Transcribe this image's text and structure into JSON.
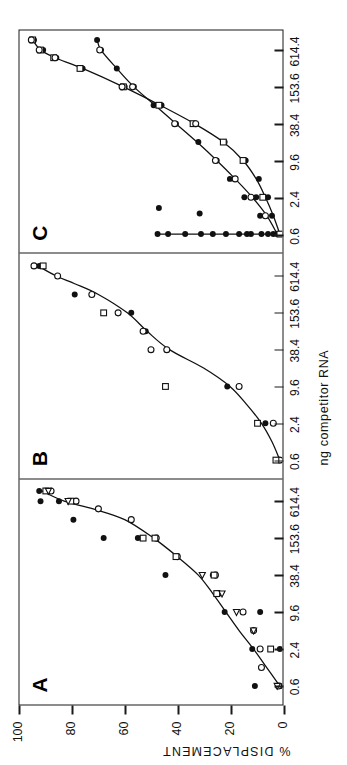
{
  "figure": {
    "caption_axis_x": "ng competitor RNA",
    "caption_axis_y": "% DISPLACEMENT",
    "panel_labels": [
      "A",
      "B",
      "C"
    ]
  },
  "chart_data": [
    {
      "type": "scatter",
      "panel": "A",
      "title": "A",
      "xlabel": "ng competitor RNA",
      "ylabel": "% DISPLACEMENT",
      "xlim": [
        0.3,
        1400
      ],
      "ylim": [
        0,
        100
      ],
      "xscale": "log",
      "xticks": [
        0.6,
        2.4,
        9.6,
        38.4,
        153.6,
        614.4
      ],
      "xticklabels": [
        "0.6",
        "2.4",
        "9.6",
        "38.4",
        "153.6",
        "614.4"
      ],
      "yticks": [
        0,
        20,
        40,
        60,
        80,
        100
      ],
      "yticklabels": [
        "0",
        "20",
        "40",
        "60",
        "80",
        "100"
      ],
      "grid": false,
      "legend": "none",
      "series": [
        {
          "name": "filled-circle",
          "marker": "filled-circle",
          "points": [
            [
              0.6,
              10.5
            ],
            [
              2.4,
              11.5
            ],
            [
              2.4,
              1.0
            ],
            [
              9.6,
              22.0
            ],
            [
              9.6,
              8.5
            ],
            [
              38.4,
              26.5
            ],
            [
              38.4,
              44.5
            ],
            [
              153.6,
              53.5
            ],
            [
              153.6,
              55.0
            ],
            [
              153.6,
              68.0
            ],
            [
              307.2,
              79.5
            ],
            [
              614.4,
              85.0
            ],
            [
              614.4,
              92.0
            ],
            [
              900.0,
              92.5
            ],
            [
              0.6,
              0.8
            ]
          ]
        },
        {
          "name": "open-circle",
          "marker": "open-circle",
          "points": [
            [
              0.6,
              1.5
            ],
            [
              1.2,
              8.0
            ],
            [
              2.4,
              8.5
            ],
            [
              4.8,
              11.0
            ],
            [
              9.6,
              15.0
            ],
            [
              19.2,
              24.5
            ],
            [
              38.4,
              25.5
            ],
            [
              76.8,
              40.0
            ],
            [
              153.6,
              48.0
            ],
            [
              307.2,
              57.5
            ],
            [
              460.0,
              70.0
            ],
            [
              614.4,
              78.5
            ],
            [
              900.0,
              88.0
            ]
          ]
        },
        {
          "name": "open-square",
          "marker": "open-square",
          "points": [
            [
              2.4,
              4.5
            ],
            [
              19.2,
              25.0
            ],
            [
              38.4,
              26.0
            ],
            [
              76.8,
              40.5
            ],
            [
              153.6,
              48.5
            ],
            [
              153.6,
              53.0
            ],
            [
              614.4,
              80.5
            ],
            [
              900.0,
              90.0
            ]
          ]
        },
        {
          "name": "open-triangle",
          "marker": "open-triangle",
          "points": [
            [
              0.6,
              2.0
            ],
            [
              4.8,
              11.0
            ],
            [
              9.6,
              17.5
            ],
            [
              19.2,
              23.0
            ],
            [
              38.4,
              30.5
            ],
            [
              614.4,
              81.5
            ],
            [
              900.0,
              89.0
            ]
          ]
        }
      ],
      "fitted_curve": [
        [
          0.6,
          1.0
        ],
        [
          1.2,
          6.0
        ],
        [
          2.4,
          11.0
        ],
        [
          4.8,
          16.5
        ],
        [
          9.6,
          21.5
        ],
        [
          19.2,
          26.5
        ],
        [
          38.4,
          32.0
        ],
        [
          76.8,
          40.0
        ],
        [
          153.6,
          49.0
        ],
        [
          307.2,
          60.0
        ],
        [
          460.0,
          72.0
        ],
        [
          614.4,
          83.0
        ],
        [
          900.0,
          91.5
        ]
      ]
    },
    {
      "type": "scatter",
      "panel": "B",
      "title": "B",
      "xlabel": "ng competitor RNA",
      "ylabel": "% DISPLACEMENT",
      "xlim": [
        0.3,
        1400
      ],
      "ylim": [
        0,
        100
      ],
      "xscale": "log",
      "xticks": [
        0.6,
        2.4,
        9.6,
        38.4,
        153.6,
        614.4
      ],
      "xticklabels": [
        "0.6",
        "2.4",
        "9.6",
        "38.4",
        "153.6",
        "614.4"
      ],
      "yticks": [
        0,
        20,
        40,
        60,
        80,
        100
      ],
      "grid": false,
      "legend": "none",
      "series": [
        {
          "name": "filled-circle",
          "marker": "filled-circle",
          "points": [
            [
              0.6,
              2.5
            ],
            [
              0.6,
              0.5
            ],
            [
              2.4,
              6.5
            ],
            [
              9.6,
              21.0
            ],
            [
              38.4,
              44.0
            ],
            [
              76.8,
              52.0
            ],
            [
              153.6,
              57.5
            ],
            [
              307.2,
              79.0
            ],
            [
              900.0,
              92.5
            ]
          ]
        },
        {
          "name": "open-circle",
          "marker": "open-circle",
          "points": [
            [
              0.6,
              1.0
            ],
            [
              2.4,
              3.5
            ],
            [
              9.6,
              16.5
            ],
            [
              38.4,
              44.0
            ],
            [
              38.4,
              50.0
            ],
            [
              76.8,
              53.0
            ],
            [
              153.6,
              62.5
            ],
            [
              307.2,
              72.5
            ],
            [
              614.4,
              85.5
            ],
            [
              900.0,
              94.5
            ]
          ]
        },
        {
          "name": "open-square",
          "marker": "open-square",
          "points": [
            [
              0.6,
              2.5
            ],
            [
              2.4,
              9.5
            ],
            [
              9.6,
              44.5
            ],
            [
              153.6,
              68.0
            ],
            [
              900.0,
              91.0
            ]
          ]
        }
      ],
      "fitted_curve": [
        [
          0.6,
          1.0
        ],
        [
          1.2,
          4.0
        ],
        [
          2.4,
          8.0
        ],
        [
          4.8,
          13.5
        ],
        [
          9.6,
          20.0
        ],
        [
          19.2,
          30.0
        ],
        [
          38.4,
          43.0
        ],
        [
          76.8,
          51.5
        ],
        [
          153.6,
          59.0
        ],
        [
          307.2,
          70.0
        ],
        [
          460.0,
          79.0
        ],
        [
          614.4,
          86.0
        ],
        [
          900.0,
          93.0
        ]
      ]
    },
    {
      "type": "scatter",
      "panel": "C",
      "title": "C",
      "xlabel": "ng competitor RNA",
      "ylabel": "% DISPLACEMENT",
      "xlim": [
        0.3,
        1400
      ],
      "ylim": [
        0,
        100
      ],
      "xscale": "log",
      "xticks": [
        0.6,
        2.4,
        9.6,
        38.4,
        153.6,
        614.4
      ],
      "xticklabels": [
        "0.6",
        "2.4",
        "9.6",
        "38.4",
        "153.6",
        "614.4"
      ],
      "yticks": [
        0,
        20,
        40,
        60,
        80,
        100
      ],
      "grid": false,
      "legend": "none",
      "comment": "three response groups: a non-competing flat baseline near 0%, an intermediate curve saturating near 70%, and a strong competitor curve saturating near 95%",
      "series": [
        {
          "name": "baseline-filled-circle",
          "marker": "filled-circle",
          "points": [
            [
              0.6,
              0.5
            ],
            [
              0.6,
              3.5
            ],
            [
              0.6,
              5.5
            ],
            [
              0.6,
              8.0
            ],
            [
              0.6,
              12.0
            ],
            [
              0.6,
              13.5
            ],
            [
              0.6,
              16.5
            ],
            [
              0.6,
              21.5
            ],
            [
              0.6,
              26.5
            ],
            [
              0.6,
              31.0
            ],
            [
              0.6,
              37.0
            ],
            [
              1.3,
              31.5
            ],
            [
              0.6,
              43.5
            ],
            [
              0.6,
              47.5
            ],
            [
              1.6,
              47.0
            ]
          ]
        },
        {
          "name": "mid-curve-filled-circle",
          "marker": "filled-circle",
          "points": [
            [
              0.6,
              2.0
            ],
            [
              1.2,
              4.0
            ],
            [
              1.2,
              8.5
            ],
            [
              2.4,
              10.0
            ],
            [
              2.4,
              14.5
            ],
            [
              4.8,
              20.0
            ],
            [
              9.6,
              25.0
            ],
            [
              19.2,
              32.0
            ],
            [
              38.4,
              40.5
            ],
            [
              76.8,
              49.0
            ],
            [
              153.6,
              56.5
            ],
            [
              307.2,
              63.0
            ],
            [
              614.4,
              69.0
            ],
            [
              900.0,
              70.5
            ]
          ]
        },
        {
          "name": "mid-curve-open-circle",
          "marker": "open-circle",
          "points": [
            [
              1.2,
              6.5
            ],
            [
              2.4,
              12.0
            ],
            [
              4.8,
              18.0
            ],
            [
              9.6,
              25.5
            ],
            [
              38.4,
              41.0
            ],
            [
              153.6,
              57.0
            ],
            [
              614.4,
              69.5
            ]
          ]
        },
        {
          "name": "strong-filled-circle",
          "marker": "filled-circle",
          "points": [
            [
              0.6,
              1.5
            ],
            [
              2.4,
              5.5
            ],
            [
              4.8,
              9.0
            ],
            [
              9.6,
              14.0
            ],
            [
              19.2,
              22.0
            ],
            [
              38.4,
              33.5
            ],
            [
              76.8,
              46.0
            ],
            [
              153.6,
              60.0
            ],
            [
              307.2,
              76.0
            ],
            [
              460.0,
              86.0
            ],
            [
              614.4,
              91.0
            ],
            [
              900.0,
              94.5
            ]
          ]
        },
        {
          "name": "strong-open-square",
          "marker": "open-square",
          "points": [
            [
              0.6,
              1.0
            ],
            [
              2.4,
              7.5
            ],
            [
              9.6,
              15.0
            ],
            [
              19.2,
              22.5
            ],
            [
              38.4,
              34.0
            ],
            [
              76.8,
              47.0
            ],
            [
              153.6,
              60.5
            ],
            [
              307.2,
              77.0
            ],
            [
              460.0,
              87.0
            ],
            [
              614.4,
              92.0
            ],
            [
              900.0,
              95.0
            ]
          ]
        },
        {
          "name": "strong-open-circle",
          "marker": "open-circle",
          "points": [
            [
              38.4,
              33.0
            ],
            [
              153.6,
              61.0
            ],
            [
              460.0,
              86.5
            ],
            [
              614.4,
              92.5
            ],
            [
              900.0,
              95.5
            ]
          ]
        }
      ],
      "fitted_curves": [
        {
          "name": "baseline-flat",
          "points": [
            [
              0.6,
              0.5
            ],
            [
              0.6,
              47.0
            ]
          ]
        },
        {
          "name": "mid-curve",
          "points": [
            [
              0.6,
              2.0
            ],
            [
              1.2,
              6.0
            ],
            [
              2.4,
              11.5
            ],
            [
              4.8,
              18.0
            ],
            [
              9.6,
              25.0
            ],
            [
              19.2,
              32.5
            ],
            [
              38.4,
              40.5
            ],
            [
              76.8,
              48.5
            ],
            [
              153.6,
              56.5
            ],
            [
              307.2,
              63.0
            ],
            [
              614.4,
              69.0
            ],
            [
              900.0,
              70.5
            ]
          ]
        },
        {
          "name": "strong-curve",
          "points": [
            [
              0.6,
              1.0
            ],
            [
              1.2,
              3.5
            ],
            [
              2.4,
              6.5
            ],
            [
              4.8,
              10.0
            ],
            [
              9.6,
              15.0
            ],
            [
              19.2,
              22.5
            ],
            [
              38.4,
              33.5
            ],
            [
              76.8,
              46.5
            ],
            [
              153.6,
              60.5
            ],
            [
              307.2,
              76.0
            ],
            [
              460.0,
              86.5
            ],
            [
              614.4,
              92.0
            ],
            [
              900.0,
              95.0
            ]
          ]
        }
      ]
    }
  ]
}
